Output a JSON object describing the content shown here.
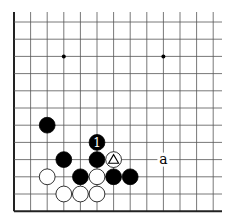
{
  "board": {
    "cols": 13,
    "rows": 12,
    "origin_x": 14,
    "origin_y": 22,
    "spacing_x": 16.6,
    "spacing_y": 17.2,
    "line_extent_right": 222,
    "line_extent_top": 12,
    "colors": {
      "line": "#555555",
      "border": "#222222",
      "black_stone": "#000000",
      "white_stone": "#ffffff",
      "background": "#ffffff"
    },
    "star_points": [
      {
        "col": 3,
        "row": 2
      },
      {
        "col": 9,
        "row": 2
      }
    ],
    "stones": [
      {
        "color": "black",
        "col": 2,
        "row": 6
      },
      {
        "color": "black",
        "col": 5,
        "row": 7,
        "label": "1"
      },
      {
        "color": "black",
        "col": 3,
        "row": 8
      },
      {
        "color": "black",
        "col": 5,
        "row": 8
      },
      {
        "color": "white",
        "col": 6,
        "row": 8,
        "marker": "triangle"
      },
      {
        "color": "white",
        "col": 2,
        "row": 9
      },
      {
        "color": "black",
        "col": 4,
        "row": 9
      },
      {
        "color": "white",
        "col": 5,
        "row": 9
      },
      {
        "color": "black",
        "col": 6,
        "row": 9
      },
      {
        "color": "black",
        "col": 7,
        "row": 9
      },
      {
        "color": "white",
        "col": 3,
        "row": 10
      },
      {
        "color": "white",
        "col": 4,
        "row": 10
      },
      {
        "color": "white",
        "col": 5,
        "row": 10
      }
    ],
    "labels": [
      {
        "text": "a",
        "col": 9,
        "row": 8
      }
    ]
  }
}
